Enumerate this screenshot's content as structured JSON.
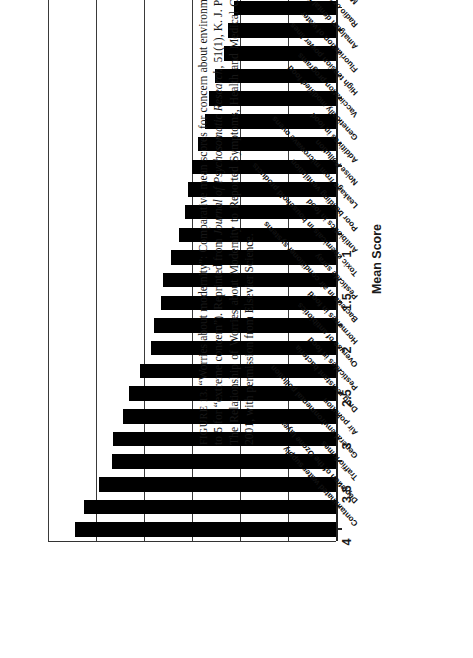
{
  "figure": {
    "caption_prefix": "FIGURE 13.",
    "caption_text": " “Worries about modernity”: Comparative mean scores for concern about environmental risks (rated from 1 for “no concern” to 5 for “extreme concern”). Reprinted from ",
    "caption_journal": "Journal of Psychosomatic Research,",
    "caption_text2": " 51(1), K. J. Petrie et al., “Thoroughly Modern Worries: The Relationship of Worries about Modernity to Reported Symptoms, Health and Medical Care Utilization,” pp. 395–401. Copyright 2001, with permission from Elsevier Science."
  },
  "chart_data": {
    "type": "bar",
    "orientation": "horizontal",
    "title": "",
    "xlabel": "",
    "ylabel": "Mean Score",
    "ylim": [
      1,
      4
    ],
    "yticks": [
      "1",
      "1.5",
      "2",
      "2.5",
      "3",
      "3.5",
      "4"
    ],
    "ytick_values": [
      1,
      1.5,
      2,
      2.5,
      3,
      3.5,
      4
    ],
    "grid": true,
    "baseline": 1,
    "categories": [
      "Contaminated water supply",
      "Depletion of the Ozone layer",
      "Traffic fumes",
      "General environmental pollution",
      "Air pollution",
      "Drug resistant bacteria",
      "Pesticides in food",
      "Overuse of antibiotics",
      "Hormones in food",
      "Bacteria in air conditioner systems",
      "Pesticide spray",
      "Toxic chemicals in household products",
      "Antibiotics in food",
      "Poor building ventilation",
      "Leakage from microwave ovens",
      "Noise Pollution",
      "Additives in food",
      "Genetically modified food",
      "Vaccination programs",
      "High tension power lines",
      "Fluoridation of water",
      "Amalgam dental fillings",
      "Radio or cell phone towers",
      "Medical and dental x-rays",
      "Cell phones"
    ],
    "values": [
      3.72,
      3.62,
      3.47,
      3.33,
      3.32,
      3.22,
      3.16,
      3.04,
      2.93,
      2.9,
      2.82,
      2.8,
      2.72,
      2.64,
      2.57,
      2.54,
      2.5,
      2.44,
      2.36,
      2.32,
      2.26,
      2.17,
      2.13,
      2.06,
      1.93
    ]
  }
}
